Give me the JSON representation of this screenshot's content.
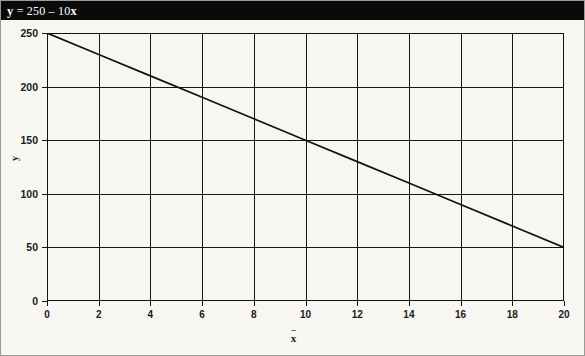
{
  "title_bar": {
    "equation_prefix": "y",
    "equation_body": " = 250 – 10",
    "equation_suffix": "x",
    "full_text": "y = 250 – 10x",
    "background_color": "#0a0a0a",
    "text_color": "#ffffff"
  },
  "chart_data": {
    "type": "line",
    "title": "y = 250 – 10x",
    "xlabel": "x",
    "ylabel": "y",
    "xlim": [
      0,
      20
    ],
    "ylim": [
      0,
      250
    ],
    "grid": true,
    "legend": "none",
    "equation": "y = 250 - 10x",
    "slope": -10,
    "intercept": 250,
    "line_color": "#111111",
    "x_ticks": [
      0,
      2,
      4,
      6,
      8,
      10,
      12,
      14,
      16,
      18,
      20
    ],
    "x_tick_labels": [
      "0",
      "2",
      "4",
      "6",
      "8",
      "10",
      "12",
      "14",
      "16",
      "18",
      "20"
    ],
    "y_ticks": [
      0,
      50,
      100,
      150,
      200,
      250
    ],
    "y_tick_labels": [
      "0",
      "50",
      "100",
      "150",
      "200",
      "250"
    ],
    "series": [
      {
        "name": "y = 250 - 10x",
        "x": [
          0,
          2,
          4,
          6,
          8,
          10,
          12,
          14,
          16,
          18,
          20
        ],
        "values": [
          250,
          230,
          210,
          190,
          170,
          150,
          130,
          110,
          90,
          70,
          50
        ]
      }
    ]
  }
}
